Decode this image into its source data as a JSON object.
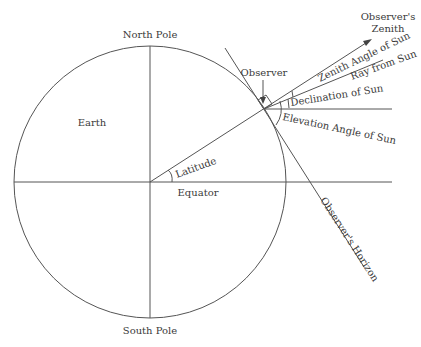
{
  "diagram": {
    "labels": {
      "north_pole": "North Pole",
      "south_pole": "South Pole",
      "earth": "Earth",
      "equator": "Equator",
      "latitude": "Latitude",
      "observer": "Observer",
      "zenith_line1": "Observer's",
      "zenith_line2": "Zenith",
      "zenith_angle": "Zenith Angle of Sun",
      "ray_from_sun": "Ray from Sun",
      "declination": "Declination of Sun",
      "elevation_angle": "Elevation Angle of Sun",
      "horizon": "Observer's Horizon"
    },
    "caption_partial": "Latitude and declination of Sun ... elevation angle of Sun"
  }
}
